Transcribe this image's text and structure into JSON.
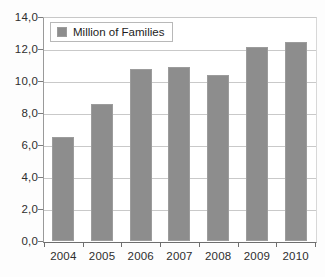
{
  "chart_data": {
    "type": "bar",
    "title": "",
    "subtitle": "",
    "xlabel": "",
    "ylabel": "",
    "categories": [
      "2004",
      "2005",
      "2006",
      "2007",
      "2008",
      "2009",
      "2010"
    ],
    "series": [
      {
        "name": "Million of Families",
        "color": "#8d8d8d",
        "values": [
          6.5,
          8.6,
          10.8,
          10.9,
          10.4,
          12.2,
          12.5
        ]
      }
    ],
    "ylim": [
      0,
      14
    ],
    "ytick_step": 2,
    "ytick_labels": [
      "0,0",
      "2,0",
      "4,0",
      "6,0",
      "8,0",
      "10,0",
      "12,0",
      "14,0"
    ],
    "ytick_values": [
      0,
      2,
      4,
      6,
      8,
      10,
      12,
      14
    ],
    "decimal_separator": ",",
    "grid": true,
    "grid_axis": "y",
    "legend": {
      "position": "top-left-inside",
      "entries": [
        {
          "label": "Million of Families",
          "swatch": "legend-swatch-icon",
          "color": "#8d8d8d"
        }
      ]
    },
    "colors": {
      "bar": "#8d8d8d",
      "bar_border": "#9c9c9c",
      "gridline": "#c9c9c9",
      "axis": "#6e6e6e",
      "text": "#2e2e2e",
      "plot_background": "#ffffff"
    }
  }
}
